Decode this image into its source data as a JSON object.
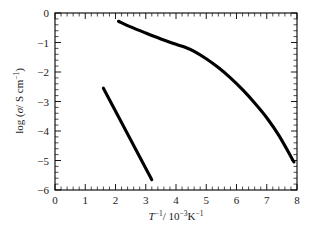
{
  "chart_data": {
    "type": "line",
    "title": "",
    "subtitle": "",
    "xlabel": "T⁻¹/ 10⁻³K⁻¹",
    "ylabel": "log (σ/ S cm⁻¹)",
    "xlim": [
      0,
      8
    ],
    "ylim": [
      -6,
      0
    ],
    "xticks": [
      0,
      1,
      2,
      3,
      4,
      5,
      6,
      7,
      8
    ],
    "yticks": [
      0,
      -1,
      -2,
      -3,
      -4,
      -5,
      -6
    ],
    "xtick_labels": [
      "0",
      "1",
      "2",
      "3",
      "4",
      "5",
      "6",
      "7",
      "8"
    ],
    "ytick_labels": [
      "0",
      "−1",
      "−2",
      "−3",
      "−4",
      "−5",
      "−6"
    ],
    "minor_ticks_per_interval": 5,
    "tick_direction": "in",
    "grid": false,
    "legend": false,
    "legend_position": "none",
    "frame_color": "#000000",
    "background_color": "#ffffff",
    "series": [
      {
        "name": "upper-curve",
        "color": "#000000",
        "line_width": 3.1,
        "x": [
          2.1,
          2.5,
          3.0,
          3.5,
          4.0,
          4.3,
          4.6,
          5.0,
          5.4,
          5.8,
          6.2,
          6.6,
          7.0,
          7.4,
          7.9
        ],
        "values": [
          -0.28,
          -0.47,
          -0.68,
          -0.88,
          -1.06,
          -1.16,
          -1.3,
          -1.55,
          -1.85,
          -2.2,
          -2.6,
          -3.05,
          -3.55,
          -4.15,
          -5.05
        ]
      },
      {
        "name": "lower-line",
        "color": "#000000",
        "line_width": 3.1,
        "x": [
          1.6,
          3.2
        ],
        "values": [
          -2.55,
          -5.65
        ]
      }
    ]
  },
  "axis_title_parts": {
    "x_symbol": "T",
    "x_symbol_sup": "−1",
    "x_slash": "/ 10",
    "x_exp": "−3",
    "x_unit": "K",
    "x_unit_sup": "−1",
    "y_prefix": "log (",
    "y_symbol": "σ",
    "y_mid": "/ S cm",
    "y_sup": "−1",
    "y_suffix": ")"
  }
}
